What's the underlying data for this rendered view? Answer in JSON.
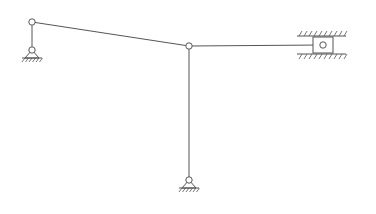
{
  "diagram": {
    "type": "planar-linkage-mechanism",
    "colors": {
      "line": "#555555",
      "background": "#ffffff"
    },
    "joints": [
      {
        "id": "A",
        "x": 32,
        "y": 22,
        "kind": "revolute"
      },
      {
        "id": "B",
        "x": 189,
        "y": 46,
        "kind": "revolute"
      },
      {
        "id": "C",
        "x": 323,
        "y": 45,
        "kind": "revolute-on-slider"
      }
    ],
    "ground_pivots": [
      {
        "id": "O1",
        "x": 32,
        "y": 50
      },
      {
        "id": "O2",
        "x": 189,
        "y": 180
      }
    ],
    "links": [
      {
        "id": "crank-left",
        "from": "O1",
        "to": "A"
      },
      {
        "id": "coupler",
        "from": "A",
        "to": "B"
      },
      {
        "id": "rocker",
        "from": "O2",
        "to": "B"
      },
      {
        "id": "connecting-rod",
        "from": "B",
        "to": "C"
      }
    ],
    "slider": {
      "x": 313,
      "y": 37,
      "w": 20,
      "h": 16,
      "guide_top_y": 36,
      "guide_bottom_y": 54,
      "guide_x1": 297,
      "guide_x2": 346
    }
  }
}
